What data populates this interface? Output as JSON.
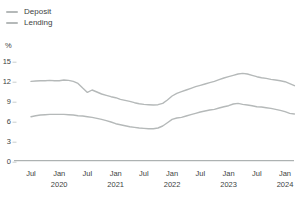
{
  "legend": {
    "position": "top-left",
    "items": [
      {
        "label": "Deposit"
      },
      {
        "label": "Lending"
      }
    ]
  },
  "chart_data": {
    "type": "line",
    "title": "",
    "ylabel": "%",
    "ylim": [
      0,
      15
    ],
    "y_ticks": [
      0,
      3,
      6,
      9,
      12,
      15
    ],
    "grid": false,
    "legend_position": "top-left",
    "x_start": "Jul 2019",
    "x_end": "Mar 2024",
    "x_freq": "monthly",
    "x_ticks": [
      {
        "i": 0,
        "m": "Jul"
      },
      {
        "i": 6,
        "m": "Jan",
        "y": "2020"
      },
      {
        "i": 12,
        "m": "Jul"
      },
      {
        "i": 18,
        "m": "Jan",
        "y": "2021"
      },
      {
        "i": 24,
        "m": "Jul"
      },
      {
        "i": 30,
        "m": "Jan",
        "y": "2022"
      },
      {
        "i": 36,
        "m": "Jul"
      },
      {
        "i": 42,
        "m": "Jan",
        "y": "2023"
      },
      {
        "i": 48,
        "m": "Jul"
      },
      {
        "i": 54,
        "m": "Jan",
        "y": "2024"
      }
    ],
    "series": [
      {
        "name": "Deposit",
        "color": "#b5b9b9",
        "values": [
          6.6,
          6.75,
          6.85,
          6.9,
          6.95,
          6.95,
          6.95,
          6.95,
          6.9,
          6.85,
          6.75,
          6.7,
          6.6,
          6.5,
          6.35,
          6.2,
          6.0,
          5.8,
          5.55,
          5.4,
          5.25,
          5.1,
          5.0,
          4.9,
          4.85,
          4.8,
          4.8,
          4.9,
          5.2,
          5.7,
          6.2,
          6.4,
          6.5,
          6.7,
          6.9,
          7.1,
          7.3,
          7.45,
          7.6,
          7.7,
          7.9,
          8.1,
          8.25,
          8.5,
          8.6,
          8.45,
          8.35,
          8.25,
          8.1,
          8.05,
          7.95,
          7.85,
          7.7,
          7.55,
          7.35,
          7.1,
          7.0
        ]
      },
      {
        "name": "Lending",
        "color": "#b5b9b9",
        "values": [
          11.9,
          11.95,
          12.0,
          12.0,
          12.05,
          12.0,
          12.0,
          12.1,
          12.05,
          11.9,
          11.6,
          10.9,
          10.25,
          10.6,
          10.3,
          10.0,
          9.8,
          9.6,
          9.45,
          9.2,
          9.05,
          8.9,
          8.7,
          8.55,
          8.45,
          8.4,
          8.35,
          8.4,
          8.6,
          9.1,
          9.7,
          10.1,
          10.35,
          10.6,
          10.85,
          11.1,
          11.3,
          11.5,
          11.7,
          11.9,
          12.15,
          12.4,
          12.6,
          12.8,
          13.0,
          13.1,
          13.0,
          12.8,
          12.6,
          12.45,
          12.35,
          12.2,
          12.1,
          12.0,
          11.85,
          11.55,
          11.25
        ]
      }
    ],
    "colors": {
      "axis": "#9aa0a0",
      "tick_text": "#3d4242",
      "line_gray": "#b5b9b9"
    }
  }
}
